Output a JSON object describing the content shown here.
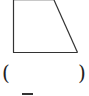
{
  "figure": {
    "shape": "trapezoid",
    "stroke_color": "#333333",
    "top_edge_color": "#c8c8c8",
    "points": {
      "top_left": [
        13,
        0
      ],
      "top_right": [
        54,
        0
      ],
      "bottom_right": [
        77,
        52
      ],
      "bottom_left": [
        13,
        52
      ]
    }
  },
  "answer": {
    "open_paren": "(",
    "blank": "",
    "close_paren": ")"
  }
}
